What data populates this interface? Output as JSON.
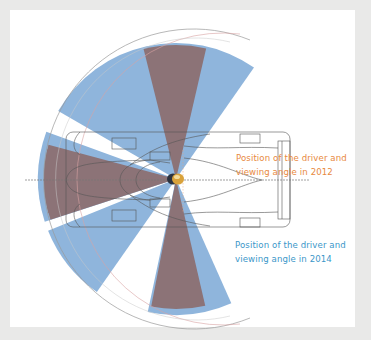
{
  "diagram": {
    "labels": {
      "y2012": {
        "line1": "Position of the driver and",
        "line2": "viewing angle in 2012"
      },
      "y2014": {
        "line1": "Position of the driver and",
        "line2": "viewing angle in 2014"
      }
    },
    "colors": {
      "background": "#e9e9e8",
      "panel": "#ffffff",
      "label_2012": "#e8893e",
      "label_2014": "#3b97c9",
      "viewing_2014_blue": "#8fb5dc",
      "viewing_2012_brown": "#8c7377",
      "car_outline": "#555555",
      "guide_red": "#d9a3a3",
      "driver_helmet": "#d9a23a"
    },
    "legend": [
      {
        "name": "2012 driver position",
        "color": "#e8893e"
      },
      {
        "name": "2014 driver position",
        "color": "#3b97c9"
      }
    ]
  }
}
